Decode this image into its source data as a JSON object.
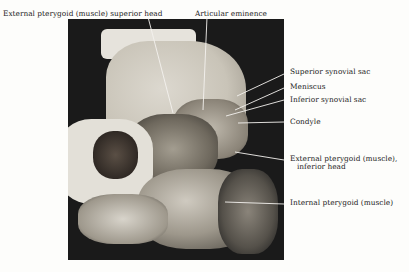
{
  "figure": {
    "labels": {
      "ext_pterygoid_superior": "External pterygoid (muscle) superior head",
      "articular_eminence": "Articular eminence",
      "superior_synovial_sac": "Superior synovial sac",
      "meniscus": "Meniscus",
      "inferior_synovial_sac": "Inferior synovial sac",
      "condyle": "Condyle",
      "ext_pterygoid_inferior_1": "External pterygoid (muscle),",
      "ext_pterygoid_inferior_2": "inferior head",
      "internal_pterygoid": "Internal pterygoid (muscle)"
    }
  }
}
